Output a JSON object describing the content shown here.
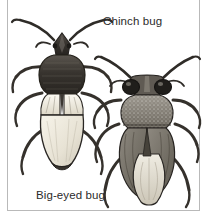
{
  "figure": {
    "background_color": "#ffffff",
    "frame_color": "#b9b9b9",
    "text_color": "#2b2b2b",
    "top_cropped_text": "",
    "labels": {
      "chinch": "Chinch bug",
      "big_eyed": "Big-eyed bug"
    },
    "illustrations": [
      {
        "name": "chinch-bug",
        "label": "Chinch bug",
        "position": "upper-left",
        "description": "Dark head and pronotum, pale whitish wings and abdomen, long curved antennae, six dark legs",
        "body_color": "#3a3632",
        "wing_color": "#f0ece1",
        "outline_color": "#2a2724"
      },
      {
        "name": "big-eyed-bug",
        "label": "Big-eyed bug",
        "position": "lower-right",
        "description": "Broad head with large bulging dark eyes, speckled pronotum, mottled gray wings over pale membrane, long legs",
        "body_color": "#6e6a63",
        "eye_color": "#262320",
        "wing_color": "#b5b0a6",
        "outline_color": "#2a2724"
      }
    ]
  }
}
